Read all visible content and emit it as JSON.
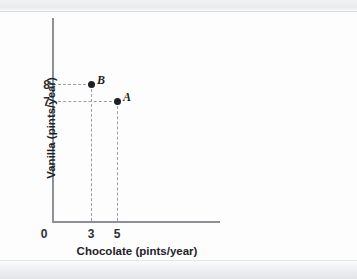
{
  "chart_data": {
    "type": "scatter",
    "title": "",
    "xlabel": "Chocolate (pints/year)",
    "ylabel": "Vanilla (pints/year)",
    "xlim": [
      0,
      13
    ],
    "ylim": [
      0,
      11
    ],
    "grid": false,
    "legend": "none",
    "x_ticks": [
      "0",
      "3",
      "5"
    ],
    "y_ticks": [
      "8",
      "7"
    ],
    "origin_label": "0",
    "points": [
      {
        "label": "B",
        "x": 3,
        "y": 8,
        "x_tick": "3",
        "y_tick": "8"
      },
      {
        "label": "A",
        "x": 5,
        "y": 7,
        "x_tick": "5",
        "y_tick": "7"
      }
    ],
    "annotations": [
      "Dashed guide lines connect each point to its axis values"
    ]
  },
  "axes": {
    "x_title": "Chocolate (pints/year)",
    "y_title": "Vanilla (pints/year)",
    "x_tick_0": "0",
    "x_tick_3": "3",
    "x_tick_5": "5",
    "y_tick_8": "8",
    "y_tick_7": "7"
  },
  "points": {
    "b_label": "B",
    "a_label": "A"
  },
  "colors": {
    "axis": "#8d9196",
    "guide": "#9aa0a6",
    "marker": "#1c1f24",
    "text": "#1f2329",
    "background": "#fdfdfe"
  }
}
